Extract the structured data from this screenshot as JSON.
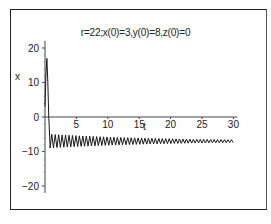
{
  "chart_data": {
    "type": "line",
    "title": "r=22;x(0)=3,y(0)=8,z(0)=0",
    "xlabel": "t",
    "ylabel": "x",
    "xlim": [
      0,
      30
    ],
    "ylim": [
      -22,
      22
    ],
    "x_ticks": [
      5,
      10,
      15,
      20,
      25,
      30
    ],
    "y_ticks": [
      20,
      10,
      0,
      -10,
      -20
    ],
    "grid": false,
    "legend": null,
    "series": [
      {
        "name": "x(t)",
        "description": "Lorenz system x-component: starts at 3, spikes up to ~17 near t≈0.3, drops sharply to ~-9, then damped oscillation between about -5 and -9 converging toward ~-7 by t=30",
        "x": [
          0,
          0.15,
          0.3,
          0.45,
          0.6,
          0.8,
          1.0,
          1.5,
          2,
          5,
          10,
          15,
          20,
          25,
          30
        ],
        "y": [
          3,
          12,
          17,
          10,
          0,
          -8,
          -9,
          -6,
          -9,
          -8.5,
          -8,
          -7.5,
          -7.2,
          -7.1,
          -7
        ]
      }
    ],
    "oscillation": {
      "start_t": 0.8,
      "end_t": 30,
      "center": -7,
      "initial_amplitude": 2,
      "final_amplitude": 0.4,
      "period": 0.55
    }
  }
}
